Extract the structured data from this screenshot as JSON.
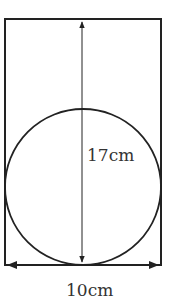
{
  "diagram": {
    "shapes": {
      "rectangle": {
        "description": "rectangle enclosing a circle"
      },
      "circle": {
        "description": "circle inscribed at the bottom of the rectangle, touching both sides and bottom"
      }
    },
    "dimensions": {
      "height_label": "17cm",
      "width_label": "10cm"
    },
    "colors": {
      "stroke": "#222222",
      "text": "#333333"
    }
  }
}
